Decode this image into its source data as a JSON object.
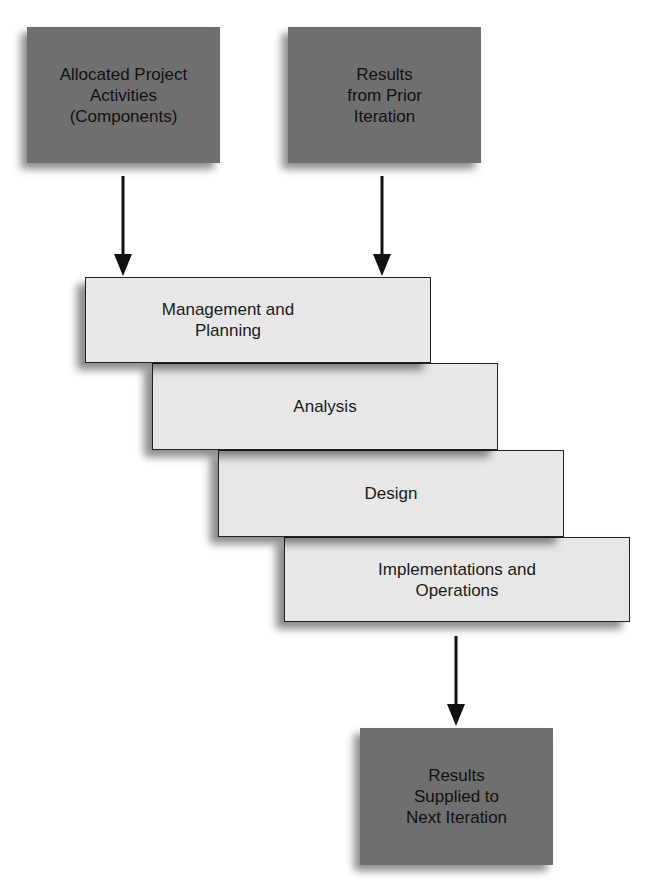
{
  "inputs": {
    "allocated": "Allocated Project\nActivities\n(Components)",
    "prior": "Results\nfrom Prior\nIteration"
  },
  "phases": [
    "Management and\nPlanning",
    "Analysis",
    "Design",
    "Implementations and\nOperations"
  ],
  "output": "Results\nSupplied to\nNext Iteration",
  "colors": {
    "dark_box": "#6f6f6f",
    "light_box": "#e7e7e7",
    "arrow": "#111111"
  }
}
